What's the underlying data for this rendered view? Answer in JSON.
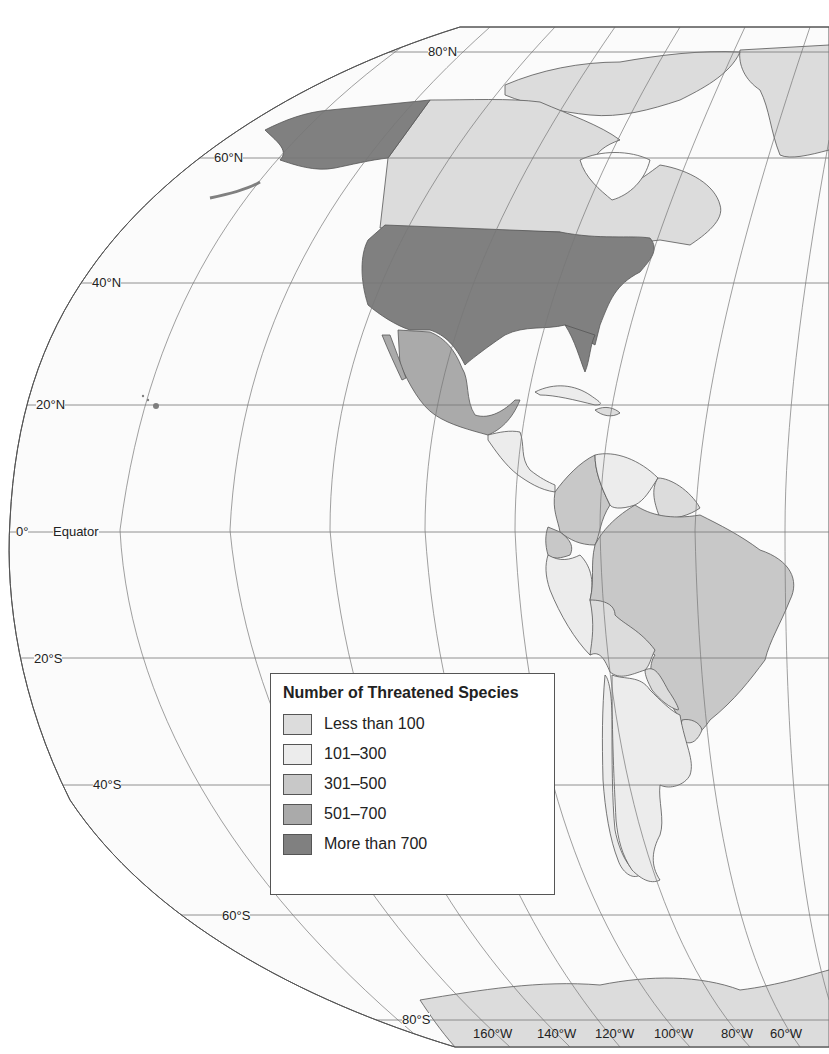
{
  "map": {
    "title": "Number of Threatened Species",
    "projection": "Robinson-style oblique world projection centered on the Americas",
    "region": "Western Hemisphere (North America, Central America, South America, Antarctica)"
  },
  "legend": {
    "title": "Number of Threatened Species",
    "items": [
      {
        "label": "Less than 100",
        "color": "#dcdcdc"
      },
      {
        "label": "101–300",
        "color": "#ececec"
      },
      {
        "label": "301–500",
        "color": "#c8c8c8"
      },
      {
        "label": "501–700",
        "color": "#aaaaaa"
      },
      {
        "label": "More than 700",
        "color": "#808080"
      }
    ]
  },
  "latitude_labels": {
    "n80": "80°N",
    "n60": "60°N",
    "n40": "40°N",
    "n20": "20°N",
    "eq_deg": "0°",
    "eq_name": "Equator",
    "s20": "20°S",
    "s40": "40°S",
    "s60": "60°S",
    "s80": "80°S"
  },
  "longitude_labels": [
    "160°W",
    "140°W",
    "120°W",
    "100°W",
    "80°W",
    "60°W"
  ],
  "regions": [
    {
      "name": "Alaska (USA)",
      "class": "More than 700"
    },
    {
      "name": "United States",
      "class": "More than 700"
    },
    {
      "name": "Canada",
      "class": "Less than 100"
    },
    {
      "name": "Greenland",
      "class": "Less than 100"
    },
    {
      "name": "Mexico",
      "class": "501–700"
    },
    {
      "name": "Central America",
      "class": "101–300"
    },
    {
      "name": "Colombia",
      "class": "301–500"
    },
    {
      "name": "Venezuela",
      "class": "101–300"
    },
    {
      "name": "Guianas",
      "class": "Less than 100"
    },
    {
      "name": "Ecuador",
      "class": "301–500"
    },
    {
      "name": "Peru",
      "class": "101–300"
    },
    {
      "name": "Brazil",
      "class": "301–500"
    },
    {
      "name": "Bolivia",
      "class": "Less than 100"
    },
    {
      "name": "Paraguay",
      "class": "Less than 100"
    },
    {
      "name": "Argentina",
      "class": "101–300"
    },
    {
      "name": "Chile",
      "class": "101–300"
    },
    {
      "name": "Uruguay",
      "class": "Less than 100"
    },
    {
      "name": "Antarctica",
      "class": "Less than 100"
    }
  ]
}
